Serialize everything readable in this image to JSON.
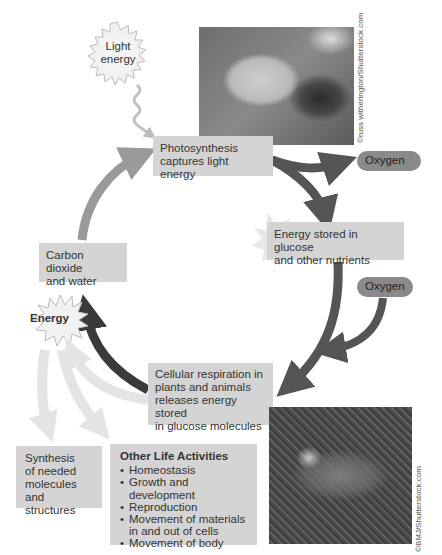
{
  "light_energy": {
    "label_line1": "Light",
    "label_line2": "energy"
  },
  "photosynthesis_box": {
    "line1": "Photosynthesis",
    "line2": "captures light energy"
  },
  "oxygen_out": {
    "label": "Oxygen"
  },
  "energy_stored_box": {
    "line1": "Energy stored in glucose",
    "line2": "and other nutrients"
  },
  "oxygen_in": {
    "label": "Oxygen"
  },
  "carbon_box": {
    "line1": "Carbon dioxide",
    "line2": "and water"
  },
  "energy_burst": {
    "label": "Energy"
  },
  "respiration_box": {
    "line1": "Cellular respiration in",
    "line2": "plants and animals",
    "line3": "releases energy stored",
    "line4": "in glucose molecules"
  },
  "synthesis_box": {
    "line1": "Synthesis",
    "line2": "of needed",
    "line3": "molecules",
    "line4": "and structures"
  },
  "other_life": {
    "title": "Other Life Activities",
    "items": [
      "Homeostasis",
      "Growth and development",
      "Reproduction",
      "Movement of materials",
      "in and out of cells",
      "Movement of body"
    ]
  },
  "leaf_photo": {
    "credit": "©russ witherington/Shutterstock.com"
  },
  "wolf_photo": {
    "credit": "©BMJ/Shutterstock.com"
  },
  "colors": {
    "box_fill": "#d4d4d4",
    "pill_fill": "#8a8a8a",
    "arrow_light": "#9a9a9a",
    "arrow_dark": "#555555",
    "arrow_darkest": "#3a3a3a",
    "pale_arrow": "#e6e6e6"
  }
}
